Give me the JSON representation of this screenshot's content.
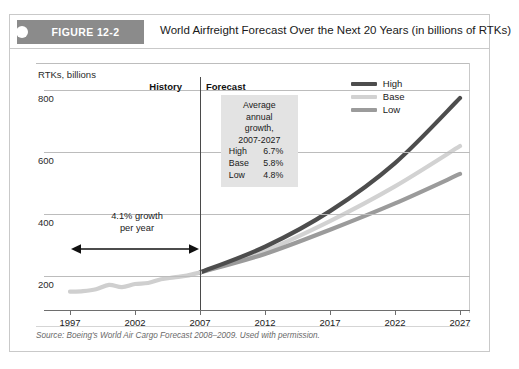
{
  "figure": {
    "tag": "FIGURE 12-2",
    "title": "World Airfreight Forecast Over the Next 20 Years (in billions of RTKs)",
    "source": "Source: Boeing's World Air Cargo Forecast 2008–2009. Used with permission."
  },
  "segments": {
    "history_label": "History",
    "forecast_label": "Forecast"
  },
  "annotation": {
    "line1": "Average annual",
    "line2": "growth,",
    "line3": "2007-2027",
    "rows": [
      {
        "name": "High",
        "value": "6.7%"
      },
      {
        "name": "Base",
        "value": "5.8%"
      },
      {
        "name": "Low",
        "value": "4.8%"
      }
    ]
  },
  "growth_note": {
    "line1": "4.1% growth",
    "line2": "per year"
  },
  "legend": [
    {
      "label": "High",
      "color": "#4d4d4d"
    },
    {
      "label": "Base",
      "color": "#d2d2d2"
    },
    {
      "label": "Low",
      "color": "#9b9b9b"
    }
  ],
  "colors": {
    "tag_bg": "#8b8b8b",
    "annotation_bg": "#e3e3e3",
    "grid": "#bcbcbc",
    "axis": "#6e6e6e",
    "high": "#4d4d4d",
    "base": "#d2d2d2",
    "low": "#9b9b9b",
    "history": "#cfcfcf"
  },
  "chart_data": {
    "type": "line",
    "title": "World Airfreight Forecast Over the Next 20 Years (in billions of RTKs)",
    "xlabel": "",
    "ylabel": "RTKs, billions",
    "y_caption": "RTKs, billions",
    "xlim": [
      1997,
      2027
    ],
    "ylim": [
      120,
      830
    ],
    "yticks": [
      200,
      400,
      600,
      800
    ],
    "xticks": [
      1997,
      2002,
      2007,
      2012,
      2017,
      2022,
      2027
    ],
    "grid": true,
    "legend_position": "top-right",
    "divider_year": 2007,
    "series": [
      {
        "name": "History",
        "color": "#cfcfcf",
        "x": [
          1997,
          1998,
          1999,
          2000,
          2001,
          2002,
          2003,
          2004,
          2005,
          2006,
          2007
        ],
        "values": [
          150,
          152,
          158,
          172,
          165,
          175,
          178,
          190,
          196,
          202,
          212
        ]
      },
      {
        "name": "High",
        "color": "#4d4d4d",
        "x": [
          2007,
          2012,
          2017,
          2022,
          2027
        ],
        "values": [
          212,
          295,
          410,
          565,
          775
        ]
      },
      {
        "name": "Base",
        "color": "#d2d2d2",
        "x": [
          2007,
          2012,
          2017,
          2022,
          2027
        ],
        "values": [
          212,
          282,
          378,
          490,
          620
        ]
      },
      {
        "name": "Low",
        "color": "#9b9b9b",
        "x": [
          2007,
          2012,
          2017,
          2022,
          2027
        ],
        "values": [
          212,
          272,
          350,
          435,
          530
        ]
      }
    ],
    "annotations": [
      {
        "text": "4.1% growth per year",
        "x_range": [
          1997,
          2007
        ],
        "y": 300
      },
      {
        "text": "Average annual growth, 2007-2027: High 6.7%, Base 5.8%, Low 4.8%",
        "x": 2010,
        "y": 700
      }
    ]
  }
}
